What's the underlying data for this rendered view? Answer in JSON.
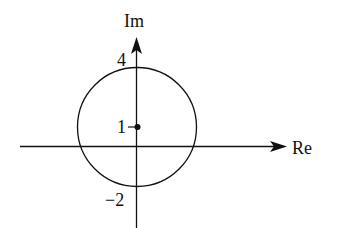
{
  "diagram": {
    "type": "complex-plane",
    "axes": {
      "real_label": "Re",
      "imag_label": "Im"
    },
    "circle": {
      "center": {
        "re": 0,
        "im": 1
      },
      "radius": 3
    },
    "center_point": {
      "re": 0,
      "im": 1
    },
    "tick_labels": {
      "top": "4",
      "center": "1",
      "bottom": "−2"
    },
    "colors": {
      "stroke": "#111111",
      "background": "#ffffff"
    }
  }
}
